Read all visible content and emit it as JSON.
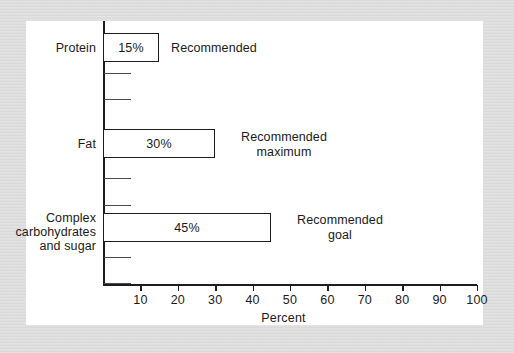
{
  "figure": {
    "background_color": "#d9d9d9",
    "panel_color": "#ffffff",
    "ink_color": "#1d1d1d"
  },
  "chart_data": {
    "type": "bar",
    "orientation": "horizontal",
    "title": "",
    "xlabel": "Percent",
    "ylabel": "",
    "xlim": [
      0,
      100
    ],
    "grid": false,
    "legend": "none",
    "categories": [
      "Protein",
      "Fat",
      "Complex carbohydrates and sugar"
    ],
    "values": [
      15,
      30,
      45
    ],
    "value_labels": [
      "15%",
      "30%",
      "45%"
    ],
    "annotations": [
      "Recommended",
      "Recommended maximum",
      "Recommended goal"
    ],
    "xticks": [
      10,
      20,
      30,
      40,
      50,
      60,
      70,
      80,
      90,
      100
    ],
    "xtick_labels": [
      "10",
      "20",
      "30",
      "40",
      "50",
      "60",
      "70",
      "80",
      "90",
      "100"
    ]
  },
  "bars": [
    {
      "category_line1": "Protein",
      "category_line2": "",
      "category_line3": "",
      "value_label": "15%",
      "annotation_line1": "Recommended",
      "annotation_line2": ""
    },
    {
      "category_line1": "Fat",
      "category_line2": "",
      "category_line3": "",
      "value_label": "30%",
      "annotation_line1": "Recommended",
      "annotation_line2": "maximum"
    },
    {
      "category_line1": "Complex",
      "category_line2": "carbohydrates",
      "category_line3": "and sugar",
      "value_label": "45%",
      "annotation_line1": "Recommended",
      "annotation_line2": "goal"
    }
  ],
  "axis": {
    "title": "Percent",
    "ticks": [
      "10",
      "20",
      "30",
      "40",
      "50",
      "60",
      "70",
      "80",
      "90",
      "100"
    ]
  }
}
